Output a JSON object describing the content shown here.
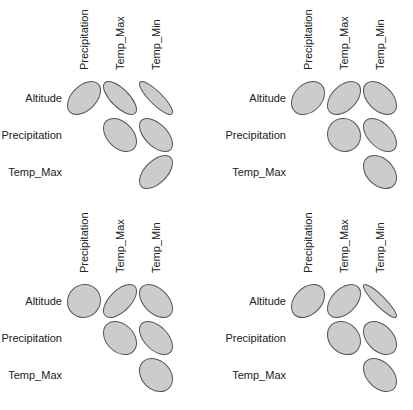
{
  "chart_data": [
    {
      "type": "heatmap",
      "subtype": "correlation-ellipse-matrix",
      "panel": 1,
      "row_labels": [
        "Altitude",
        "Precipitation",
        "Temp_Max"
      ],
      "col_labels": [
        "Precipitation",
        "Temp_Max",
        "Temp_Min"
      ],
      "cells": [
        {
          "row": "Altitude",
          "col": "Precipitation",
          "r": 0.45
        },
        {
          "row": "Altitude",
          "col": "Temp_Max",
          "r": -0.7
        },
        {
          "row": "Altitude",
          "col": "Temp_Min",
          "r": -0.85
        },
        {
          "row": "Precipitation",
          "col": "Temp_Max",
          "r": -0.4
        },
        {
          "row": "Precipitation",
          "col": "Temp_Min",
          "r": -0.55
        },
        {
          "row": "Temp_Max",
          "col": "Temp_Min",
          "r": 0.55
        }
      ],
      "grid": false,
      "legend": false
    },
    {
      "type": "heatmap",
      "subtype": "correlation-ellipse-matrix",
      "panel": 2,
      "row_labels": [
        "Altitude",
        "Precipitation",
        "Temp_Max"
      ],
      "col_labels": [
        "Precipitation",
        "Temp_Max",
        "Temp_Min"
      ],
      "cells": [
        {
          "row": "Altitude",
          "col": "Precipitation",
          "r": 0.3
        },
        {
          "row": "Altitude",
          "col": "Temp_Max",
          "r": 0.45
        },
        {
          "row": "Altitude",
          "col": "Temp_Min",
          "r": -0.45
        },
        {
          "row": "Precipitation",
          "col": "Temp_Max",
          "r": -0.05
        },
        {
          "row": "Precipitation",
          "col": "Temp_Min",
          "r": -0.5
        },
        {
          "row": "Temp_Max",
          "col": "Temp_Min",
          "r": -0.35
        }
      ],
      "grid": false,
      "legend": false
    },
    {
      "type": "heatmap",
      "subtype": "correlation-ellipse-matrix",
      "panel": 3,
      "row_labels": [
        "Altitude",
        "Precipitation",
        "Temp_Max"
      ],
      "col_labels": [
        "Precipitation",
        "Temp_Max",
        "Temp_Min"
      ],
      "cells": [
        {
          "row": "Altitude",
          "col": "Precipitation",
          "r": 0.05
        },
        {
          "row": "Altitude",
          "col": "Temp_Max",
          "r": 0.6
        },
        {
          "row": "Altitude",
          "col": "Temp_Min",
          "r": -0.45
        },
        {
          "row": "Precipitation",
          "col": "Temp_Max",
          "r": -0.3
        },
        {
          "row": "Precipitation",
          "col": "Temp_Min",
          "r": -0.5
        },
        {
          "row": "Temp_Max",
          "col": "Temp_Min",
          "r": -0.25
        }
      ],
      "grid": false,
      "legend": false
    },
    {
      "type": "heatmap",
      "subtype": "correlation-ellipse-matrix",
      "panel": 4,
      "row_labels": [
        "Altitude",
        "Precipitation",
        "Temp_Max"
      ],
      "col_labels": [
        "Precipitation",
        "Temp_Max",
        "Temp_Min"
      ],
      "cells": [
        {
          "row": "Altitude",
          "col": "Precipitation",
          "r": 0.35
        },
        {
          "row": "Altitude",
          "col": "Temp_Max",
          "r": 0.45
        },
        {
          "row": "Altitude",
          "col": "Temp_Min",
          "r": -0.9
        },
        {
          "row": "Precipitation",
          "col": "Temp_Max",
          "r": -0.2
        },
        {
          "row": "Precipitation",
          "col": "Temp_Min",
          "r": -0.4
        },
        {
          "row": "Temp_Max",
          "col": "Temp_Min",
          "r": -0.4
        }
      ],
      "grid": false,
      "legend": false
    }
  ],
  "style": {
    "ellipse_fill": "#cccccc",
    "ellipse_stroke": "#555555",
    "text_color": "#222222"
  }
}
